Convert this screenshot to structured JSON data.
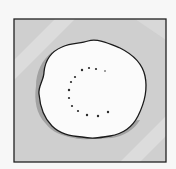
{
  "illustration": {
    "subject": "white blob on grey square with dotted C shape",
    "colors": {
      "page_background": "#f7f7f7",
      "square_fill": "#cfcfcf",
      "square_stripe": "#dedede",
      "square_border": "#222222",
      "blob_fill": "#fbfbfb",
      "blob_shadow": "#9a9a9a",
      "blob_outline": "#1a1a1a",
      "dot": "#2a2a2a"
    },
    "dots": [
      {
        "x": 82,
        "y": 70
      },
      {
        "x": 89,
        "y": 68
      },
      {
        "x": 96,
        "y": 69
      },
      {
        "x": 105,
        "y": 71
      },
      {
        "x": 75,
        "y": 77
      },
      {
        "x": 71,
        "y": 82
      },
      {
        "x": 69,
        "y": 90
      },
      {
        "x": 69,
        "y": 98
      },
      {
        "x": 72,
        "y": 106
      },
      {
        "x": 78,
        "y": 111
      },
      {
        "x": 87,
        "y": 115
      },
      {
        "x": 98,
        "y": 116
      },
      {
        "x": 108,
        "y": 112
      }
    ]
  }
}
